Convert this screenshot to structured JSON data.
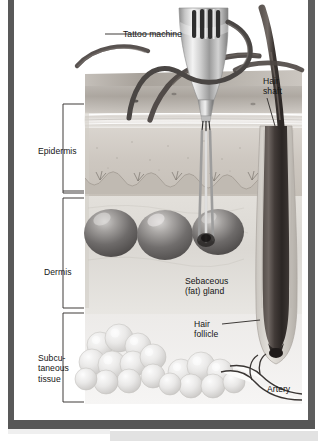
{
  "figure": {
    "title_ghost": "Tattoo needle and skin",
    "alt": "Cross-section of human skin showing a tattoo machine needle penetrating the epidermis and dermis"
  },
  "layer_labels": [
    {
      "id": "epidermis",
      "text": "Epidermis"
    },
    {
      "id": "dermis",
      "text": "Dermis"
    },
    {
      "id": "subcutaneous",
      "text": "Subcu-\ntaneous\ntissue"
    }
  ],
  "callouts": [
    {
      "id": "tattoo-machine",
      "text": "Tattoo machine"
    },
    {
      "id": "hair-shaft",
      "text": "Hair\nshaft"
    },
    {
      "id": "sebaceous",
      "text": "Sebaceous\n(fat) gland"
    },
    {
      "id": "hair-follicle",
      "text": "Hair\nfollicle"
    },
    {
      "id": "artery",
      "text": "Artery"
    }
  ],
  "colors": {
    "frame": "#595959",
    "label_text": "#151515",
    "epidermis_fill": "#cfcbc6",
    "dermis_fill": "#dedbd6",
    "subcutaneous_fill": "#ededeb",
    "hair_dark": "#3b3a3a",
    "gland_dark": "#6d6b6b",
    "machine_metal": "#c9c9c9",
    "bottom_band": "#e2e2e2"
  }
}
